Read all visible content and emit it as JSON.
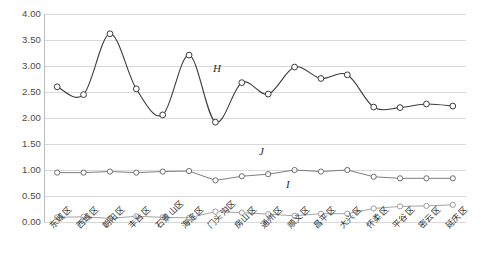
{
  "chart_data": {
    "type": "line",
    "title": "",
    "xlabel": "",
    "ylabel": "",
    "ylim": [
      0.0,
      4.0
    ],
    "ytick_step": 0.5,
    "grid": true,
    "legend": "inline-labels",
    "marker": "open-circle",
    "categories": [
      "东城区",
      "西城区",
      "朝阳区",
      "丰台区",
      "石景山区",
      "海淀区",
      "门头沟区",
      "房山区",
      "通州区",
      "顺义区",
      "昌平区",
      "大兴区",
      "怀柔区",
      "平谷区",
      "密云区",
      "延庆区"
    ],
    "ytick_labels": [
      "4.00",
      "3.50",
      "3.00",
      "2.50",
      "2.00",
      "1.50",
      "1.00",
      "0.50",
      "0.00"
    ],
    "series": [
      {
        "name": "H",
        "color": "#3c3c3c",
        "smooth": true,
        "values": [
          2.6,
          2.45,
          3.62,
          2.56,
          2.06,
          3.21,
          1.92,
          2.68,
          2.46,
          2.98,
          2.76,
          2.83,
          2.21,
          2.2,
          2.27,
          2.23
        ]
      },
      {
        "name": "J",
        "color": "#6e6e6e",
        "smooth": false,
        "values": [
          0.95,
          0.95,
          0.97,
          0.95,
          0.97,
          0.98,
          0.8,
          0.88,
          0.92,
          1.0,
          0.97,
          1.0,
          0.87,
          0.84,
          0.84,
          0.84
        ]
      },
      {
        "name": "I",
        "color": "#9a9a9a",
        "smooth": false,
        "values": [
          0.09,
          0.1,
          0.07,
          0.11,
          0.09,
          0.08,
          0.2,
          0.18,
          0.15,
          0.12,
          0.16,
          0.16,
          0.26,
          0.3,
          0.31,
          0.33
        ]
      }
    ]
  }
}
